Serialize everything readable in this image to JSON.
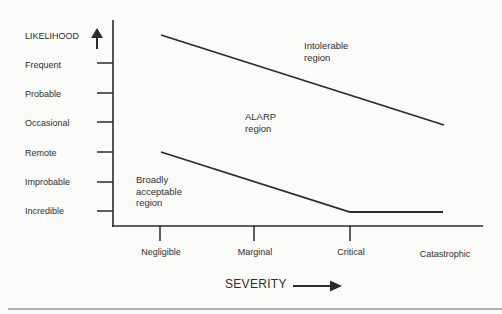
{
  "diagram": {
    "type": "ALARP risk diagram",
    "y_axis": {
      "title": "LIKELIHOOD",
      "arrow_icon": "up-arrow",
      "levels": [
        "Frequent",
        "Probable",
        "Occasional",
        "Remote",
        "Improbable",
        "Incredible"
      ]
    },
    "x_axis": {
      "title": "SEVERITY",
      "arrow_icon": "right-arrow",
      "levels": [
        "Negligible",
        "Marginal",
        "Critical",
        "Catastrophic"
      ]
    },
    "regions": [
      {
        "id": "intolerable",
        "label_line1": "Intolerable",
        "label_line2": "region"
      },
      {
        "id": "alarp",
        "label_line1": "ALARP",
        "label_line2": "region"
      },
      {
        "id": "broadly-acceptable",
        "label_line1": "Broadly",
        "label_line2": "acceptable",
        "label_line3": "region"
      }
    ],
    "boundaries": [
      {
        "name": "intolerable-alarp-boundary",
        "points": [
          [
            "Negligible",
            "above Frequent"
          ],
          [
            "Catastrophic",
            "Occasional"
          ]
        ]
      },
      {
        "name": "alarp-acceptable-boundary",
        "points": [
          [
            "Negligible",
            "Remote"
          ],
          [
            "Critical",
            "Incredible"
          ],
          [
            "Catastrophic",
            "Incredible"
          ]
        ]
      }
    ],
    "colors": {
      "background": "#fbfbfa",
      "lines": "#2b2b2b",
      "text": "#2f2f2f"
    }
  }
}
